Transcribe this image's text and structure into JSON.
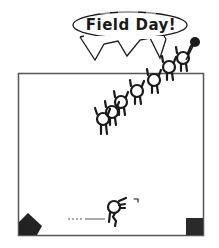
{
  "game": {
    "title": "Field Day!",
    "speech_bubble_text": "Field Day!",
    "colors": {
      "background": "#ffffff",
      "ink": "#1a1a1a",
      "frame": "#555555"
    },
    "playfield": {
      "x": 18,
      "y": 73,
      "width": 185,
      "height": 162
    },
    "sprites": {
      "climbing_figures_count": 7,
      "player_figure": "running-stick-figure",
      "left_corner_block": "pentagon-block",
      "right_corner_block": "square-block",
      "speed_trail": "dotted-line",
      "balloon": "black-balloon"
    }
  }
}
